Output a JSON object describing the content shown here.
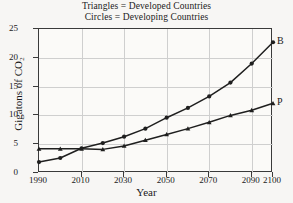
{
  "legend": {
    "line1": "Triangles = Developed Countries",
    "line2": "Circles = Developing Countries"
  },
  "axes": {
    "x_title": "Year",
    "y_title": "Gigatons of CO₂",
    "x_ticks": [
      "1990",
      "2010",
      "2030",
      "2050",
      "2070",
      "2090",
      "2100"
    ],
    "y_ticks": [
      "0",
      "5",
      "10",
      "15",
      "20",
      "25"
    ]
  },
  "series_labels": {
    "b": "B",
    "p": "P"
  },
  "colors": {
    "line": "#1f1f1f",
    "grid": "#cfcfcf",
    "frame": "#3a3a3a",
    "background": "#f7f6f4",
    "plot_background": "#fbfaf8"
  },
  "chart_data": {
    "type": "line",
    "xlabel": "Year",
    "ylabel": "Gigatons of CO2",
    "xlim": [
      1990,
      2100
    ],
    "ylim": [
      0,
      25
    ],
    "xticks": [
      1990,
      2010,
      2030,
      2050,
      2070,
      2090,
      2100
    ],
    "yticks": [
      0,
      5,
      10,
      15,
      20,
      25
    ],
    "grid": true,
    "legend": "none",
    "x": [
      1990,
      2000,
      2010,
      2020,
      2030,
      2040,
      2050,
      2060,
      2070,
      2080,
      2090,
      2100
    ],
    "series": [
      {
        "name": "B",
        "label": "B",
        "marker": "circle",
        "description": "Developing Countries",
        "values": [
          1.9,
          2.6,
          4.3,
          5.2,
          6.3,
          7.7,
          9.6,
          11.3,
          13.3,
          15.7,
          19.0,
          22.7
        ]
      },
      {
        "name": "P",
        "label": "P",
        "marker": "triangle",
        "description": "Developed Countries",
        "values": [
          4.2,
          4.2,
          4.2,
          4.1,
          4.7,
          5.7,
          6.7,
          7.7,
          8.8,
          10.0,
          10.9,
          12.1
        ]
      }
    ]
  }
}
